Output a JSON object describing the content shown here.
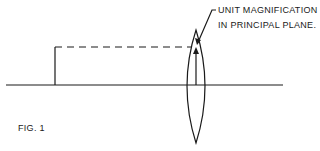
{
  "figure": {
    "caption": "FIG. 1",
    "annotation": {
      "line1": "UNIT MAGNIFICATION",
      "line2": "IN PRINCIPAL PLANE."
    }
  },
  "colors": {
    "ink": "#1a1a1a",
    "background": "#ffffff"
  },
  "geometry": {
    "optical_axis": {
      "x1": 6,
      "x2": 283,
      "y": 85
    },
    "object_line": {
      "x": 55,
      "y1": 47,
      "y2": 85
    },
    "dashed_ray": {
      "x1": 55,
      "x2": 196,
      "y": 47
    },
    "lens": {
      "cx": 196,
      "top": 30,
      "bottom": 143,
      "half_width": 14
    },
    "image_arrow": {
      "x": 196,
      "y1": 85,
      "y2": 48
    },
    "leader": {
      "x1": 213,
      "y1": 10,
      "x2": 198,
      "y2": 42
    }
  }
}
